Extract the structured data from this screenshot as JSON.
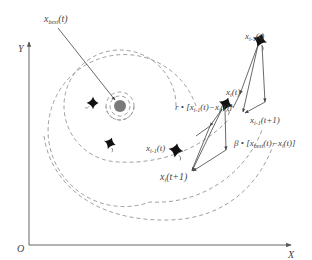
{
  "diagram": {
    "axes": {
      "x_label": "X",
      "y_label": "Y",
      "origin_label": "O"
    },
    "labels": {
      "best": {
        "main": "x",
        "sub": "best",
        "tail": "(t)"
      },
      "prev_top": {
        "main": "x",
        "sub": "i-1",
        "tail": "(t)"
      },
      "current": {
        "main": "x",
        "sub": "i",
        "tail": "(t)"
      },
      "next_top": {
        "main": "x",
        "sub": "i-1",
        "tail": "(t+1)"
      },
      "r_term": "r • [x",
      "r_term_sub": "i-1",
      "r_term_tail": "(t)−x",
      "r_term_sub2": "i",
      "r_term_end": "(t)]",
      "beta_term": "β • [x",
      "beta_term_sub": "best",
      "beta_term_tail": "(t)−x",
      "beta_term_sub2": "i",
      "beta_term_end": "(t)]",
      "prev_mid": {
        "main": "x",
        "sub": "i-1",
        "tail": "(t)"
      },
      "current_next": {
        "main": "x",
        "sub": "i",
        "tail": "(t+1)"
      }
    },
    "colors": {
      "axis": "#555555",
      "dashed": "#888888",
      "arrow": "#555555",
      "food_source": "#7a7a7a",
      "manta": "#111111",
      "text": "#444444"
    }
  }
}
